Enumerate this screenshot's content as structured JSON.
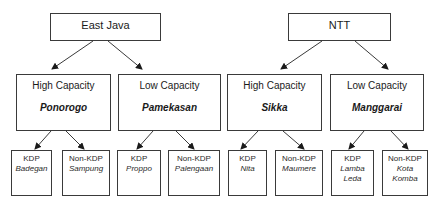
{
  "diagram": {
    "regions": [
      {
        "name": "East Java",
        "children": [
          {
            "label": "High Capacity",
            "district": "Ponorogo",
            "leaves": [
              {
                "type": "KDP",
                "place": "Badegan"
              },
              {
                "type": "Non-KDP",
                "place": "Sampung"
              }
            ]
          },
          {
            "label": "Low Capacity",
            "district": "Pamekasan",
            "leaves": [
              {
                "type": "KDP",
                "place": "Proppo"
              },
              {
                "type": "Non-KDP",
                "place": "Palengaan"
              }
            ]
          }
        ]
      },
      {
        "name": "NTT",
        "children": [
          {
            "label": "High Capacity",
            "district": "Sikka",
            "leaves": [
              {
                "type": "KDP",
                "place": "Nita"
              },
              {
                "type": "Non-KDP",
                "place": "Maumere"
              }
            ]
          },
          {
            "label": "Low Capacity",
            "district": "Manggarai",
            "leaves": [
              {
                "type": "KDP",
                "place": "Lamba\nLeda"
              },
              {
                "type": "Non-KDP",
                "place": "Kota\nKomba"
              }
            ]
          }
        ]
      }
    ],
    "colors": {
      "border": "#3a3a3a",
      "arrow": "#1a1a1a",
      "background": "#ffffff"
    }
  }
}
